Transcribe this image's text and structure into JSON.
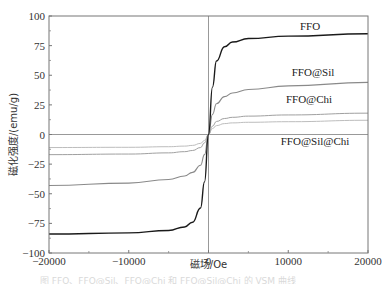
{
  "chart_data": {
    "type": "line",
    "title": "",
    "xlabel": "磁场/Oe",
    "ylabel": "磁化强度/(emu/g)",
    "xlim": [
      -20000,
      20000
    ],
    "ylim": [
      -100,
      100
    ],
    "xticks": [
      -20000,
      -10000,
      0,
      10000,
      20000
    ],
    "xtick_labels": [
      "−20000",
      "−10000",
      "0",
      "10000",
      "20000"
    ],
    "yticks": [
      -100,
      -75,
      -50,
      -25,
      0,
      25,
      50,
      75,
      100
    ],
    "ytick_labels": [
      "−100",
      "−75",
      "−50",
      "−25",
      "0",
      "25",
      "50",
      "75",
      "100"
    ],
    "grid": false,
    "reference_lines": {
      "x": 0,
      "y": 0
    },
    "legend": "inline labels",
    "series": [
      {
        "name": "FFO",
        "color": "#1a1a1a",
        "width": 1.4,
        "x": [
          -20000,
          -10000,
          -5000,
          -3000,
          -2000,
          -1000,
          -500,
          0,
          500,
          1000,
          2000,
          3000,
          5000,
          10000,
          20000
        ],
        "values": [
          -84,
          -83,
          -81,
          -78,
          -74,
          -62,
          -40,
          0,
          40,
          62,
          74,
          78,
          81,
          83,
          85
        ],
        "label_pos": [
          20,
          92
        ]
      },
      {
        "name": "FFO@Sil",
        "color": "#8a8a8a",
        "width": 1.1,
        "x": [
          -20000,
          -10000,
          -5000,
          -3000,
          -2000,
          -1000,
          -500,
          0,
          500,
          1000,
          2000,
          3000,
          5000,
          10000,
          20000
        ],
        "values": [
          -43,
          -41,
          -38,
          -35,
          -32,
          -26,
          -17,
          0,
          17,
          26,
          32,
          35,
          38,
          41,
          44
        ],
        "label_pos": [
          20,
          49
        ]
      },
      {
        "name": "FFO@Chi",
        "color": "#a0a0a0",
        "width": 1.0,
        "x": [
          -20000,
          -10000,
          -5000,
          -3000,
          -2000,
          -1000,
          -500,
          0,
          500,
          1000,
          2000,
          3000,
          5000,
          10000,
          20000
        ],
        "values": [
          -17,
          -16.5,
          -15.5,
          -14.5,
          -13.5,
          -11,
          -7,
          0,
          7,
          11,
          13.5,
          14.5,
          15.5,
          16.5,
          18
        ],
        "label_pos": [
          20,
          25
        ]
      },
      {
        "name": "FFO@Sil@Chi",
        "color": "#bdbdbd",
        "width": 1.0,
        "x": [
          -20000,
          -10000,
          -5000,
          -3000,
          -2000,
          -1000,
          -500,
          0,
          500,
          1000,
          2000,
          3000,
          5000,
          10000,
          20000
        ],
        "values": [
          -11,
          -10.8,
          -10.3,
          -9.8,
          -9.2,
          -7.5,
          -5,
          0,
          5,
          7.5,
          9.2,
          9.8,
          10.3,
          10.8,
          12
        ],
        "label_pos": [
          20,
          -7
        ]
      }
    ]
  },
  "caption": "图  FFO、FFO@Sil、FFO@Chi 和 FFO@Sil@Chi 的 VSM 曲线"
}
